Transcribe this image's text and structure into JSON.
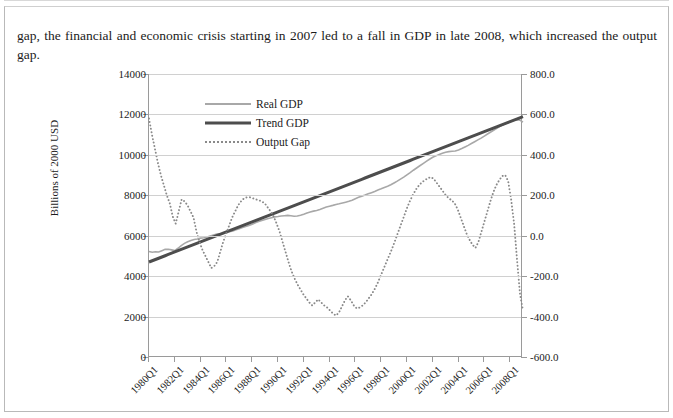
{
  "document": {
    "paragraph": "gap, the financial and economic crisis starting in 2007 led to a fall in GDP in late 2008, which increased the output gap."
  },
  "chart_data": {
    "type": "line",
    "title": "",
    "xlabel": "",
    "ylabel": "Billions of 2000 USD",
    "y2label": "",
    "ylim": [
      0,
      14000
    ],
    "y2lim": [
      -600,
      800
    ],
    "grid": true,
    "legend_position": "upper-left-inside",
    "y_ticks": [
      "0",
      "2000",
      "4000",
      "6000",
      "8000",
      "10000",
      "12000",
      "14000"
    ],
    "y2_ticks": [
      "-600.0",
      "-400.0",
      "-200.0",
      "0.0",
      "200.0",
      "400.0",
      "600.0",
      "800.0"
    ],
    "x_tick_labels": [
      "1980Q1",
      "1982Q1",
      "1984Q1",
      "1986Q1",
      "1988Q1",
      "1990Q1",
      "1992Q1",
      "1994Q1",
      "1996Q1",
      "1998Q1",
      "2000Q1",
      "2002Q1",
      "2004Q1",
      "2006Q1",
      "2008Q1"
    ],
    "x_first": "1980Q1",
    "x_last": "2009Q1",
    "n_points": 117,
    "colors": {
      "real_gdp": "#a8a8a8",
      "trend_gdp": "#4d4d4d",
      "output_gap": "#8a8a8a",
      "gridline": "#d0d0d0",
      "axis": "#9a9a9a"
    },
    "series": [
      {
        "name": "Real GDP",
        "axis": "left",
        "style": "solid-thin",
        "values": [
          5222,
          5180,
          5207,
          5192,
          5260,
          5325,
          5330,
          5300,
          5265,
          5380,
          5510,
          5620,
          5700,
          5760,
          5810,
          5840,
          5880,
          5900,
          5935,
          5990,
          6040,
          6080,
          6100,
          6110,
          6145,
          6200,
          6240,
          6290,
          6350,
          6410,
          6460,
          6510,
          6570,
          6640,
          6700,
          6750,
          6800,
          6850,
          6890,
          6930,
          6950,
          6975,
          6990,
          7005,
          6985,
          6960,
          6975,
          7010,
          7060,
          7120,
          7170,
          7215,
          7250,
          7300,
          7360,
          7420,
          7460,
          7500,
          7545,
          7580,
          7620,
          7660,
          7700,
          7760,
          7830,
          7900,
          7955,
          8010,
          8070,
          8130,
          8190,
          8260,
          8320,
          8390,
          8450,
          8520,
          8610,
          8700,
          8800,
          8900,
          9010,
          9120,
          9240,
          9350,
          9460,
          9570,
          9680,
          9780,
          9880,
          9950,
          10020,
          10080,
          10130,
          10160,
          10175,
          10190,
          10240,
          10310,
          10390,
          10470,
          10560,
          10650,
          10740,
          10830,
          10930,
          11030,
          11130,
          11230,
          11330,
          11420,
          11500,
          11570,
          11640,
          11700,
          11740,
          11720,
          11620
        ]
      },
      {
        "name": "Trend GDP",
        "axis": "left",
        "style": "solid-thick",
        "values": [
          4700,
          4762,
          4824,
          4886,
          4948,
          5010,
          5072,
          5134,
          5196,
          5258,
          5320,
          5382,
          5444,
          5506,
          5568,
          5630,
          5692,
          5754,
          5816,
          5878,
          5940,
          6002,
          6064,
          6126,
          6188,
          6250,
          6312,
          6374,
          6436,
          6498,
          6560,
          6622,
          6684,
          6746,
          6808,
          6870,
          6932,
          6994,
          7056,
          7118,
          7180,
          7242,
          7304,
          7366,
          7428,
          7490,
          7552,
          7614,
          7676,
          7738,
          7800,
          7862,
          7924,
          7986,
          8048,
          8110,
          8172,
          8234,
          8296,
          8358,
          8420,
          8482,
          8544,
          8606,
          8668,
          8730,
          8792,
          8854,
          8916,
          8978,
          9040,
          9102,
          9164,
          9226,
          9288,
          9350,
          9412,
          9474,
          9536,
          9598,
          9660,
          9722,
          9784,
          9846,
          9908,
          9970,
          10032,
          10094,
          10156,
          10218,
          10280,
          10342,
          10404,
          10466,
          10528,
          10590,
          10652,
          10714,
          10776,
          10838,
          10900,
          10962,
          11024,
          11086,
          11148,
          11210,
          11272,
          11334,
          11396,
          11458,
          11520,
          11582,
          11644,
          11706,
          11768,
          11830,
          11892
        ]
      },
      {
        "name": "Output Gap",
        "axis": "right",
        "style": "dotted",
        "values": [
          580,
          500,
          430,
          360,
          300,
          250,
          200,
          160,
          95,
          60,
          120,
          180,
          170,
          150,
          120,
          90,
          20,
          -30,
          -70,
          -100,
          -130,
          -160,
          -150,
          -130,
          -80,
          -30,
          10,
          50,
          90,
          120,
          150,
          170,
          185,
          190,
          190,
          185,
          180,
          175,
          170,
          160,
          140,
          120,
          95,
          60,
          20,
          -30,
          -80,
          -130,
          -175,
          -210,
          -240,
          -265,
          -290,
          -310,
          -330,
          -345,
          -330,
          -315,
          -330,
          -345,
          -355,
          -370,
          -385,
          -395,
          -380,
          -350,
          -320,
          -300,
          -320,
          -345,
          -360,
          -355,
          -345,
          -330,
          -310,
          -290,
          -265,
          -235,
          -200,
          -165,
          -130,
          -95,
          -60,
          -20,
          20,
          60,
          100,
          140,
          175,
          205,
          230,
          250,
          265,
          275,
          285,
          290,
          280,
          260,
          240,
          220,
          200,
          185,
          175,
          160,
          130,
          90,
          50,
          10,
          -20,
          -45,
          -60,
          -30,
          20,
          70,
          120,
          170,
          215,
          250,
          275,
          295,
          300,
          270,
          180,
          60,
          -120,
          -290,
          -370
        ]
      }
    ],
    "legend": [
      {
        "label": "Real GDP",
        "key": "solid-thin",
        "color": "#a8a8a8"
      },
      {
        "label": "Trend GDP",
        "key": "solid-thick",
        "color": "#4d4d4d"
      },
      {
        "label": "Output Gap",
        "key": "dotted",
        "color": "#8a8a8a"
      }
    ]
  }
}
